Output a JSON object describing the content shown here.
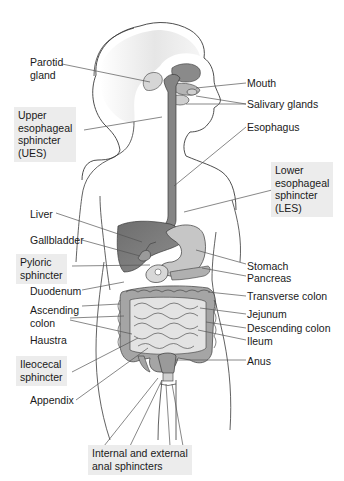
{
  "diagram": {
    "colors": {
      "background": "#ffffff",
      "organ_dark": "#7d7d7d",
      "organ_mid": "#a6a6a6",
      "organ_light": "#cfcfcf",
      "outline": "#3a3a3a",
      "leader_line": "#555555",
      "label_box": "#ececec",
      "text": "#1a1a1a"
    },
    "labels_left": {
      "parotid_gland": "Parotid\ngland",
      "upper_esophageal_sphincter": "Upper\nesophageal\nsphincter\n(UES)",
      "liver": "Liver",
      "gallbladder": "Gallbladder",
      "pyloric_sphincter": "Pyloric\nsphincter",
      "duodenum": "Duodenum",
      "ascending_colon": "Ascending\ncolon",
      "haustra": "Haustra",
      "ileocecal_sphincter": "Ileocecal\nsphincter",
      "appendix": "Appendix"
    },
    "labels_right": {
      "mouth": "Mouth",
      "salivary_glands": "Salivary glands",
      "esophagus": "Esophagus",
      "lower_esophageal_sphincter": "Lower\nesophageal\nsphincter\n(LES)",
      "stomach": "Stomach",
      "pancreas": "Pancreas",
      "transverse_colon": "Transverse colon",
      "jejunum": "Jejunum",
      "descending_colon": "Descending colon",
      "ileum": "Ileum",
      "anus": "Anus"
    },
    "labels_bottom": {
      "anal_sphincters": "Internal and external\nanal sphincters"
    },
    "highlighted_labels": [
      "Upper esophageal sphincter (UES)",
      "Lower esophageal sphincter (LES)",
      "Pyloric sphincter",
      "Ileocecal sphincter",
      "Internal and external anal sphincters"
    ]
  }
}
